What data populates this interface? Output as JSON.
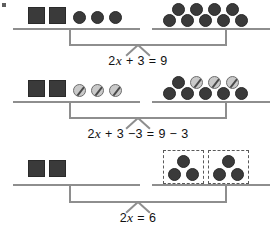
{
  "figure": {
    "background_color": "#ffffff",
    "line_color": "#8e8e8e",
    "object_fill_color": "#3a3a3a",
    "crossed_fill_color": "#c9c9c9",
    "dashbox_color": "#5a5a5a"
  },
  "steps": [
    {
      "id": "step-1",
      "equation": {
        "full": "2x + 3 = 9",
        "lhs_coefficient": "2",
        "variable": "x",
        "lhs_constant": "+ 3",
        "equals": "=",
        "rhs": "9"
      },
      "left_pan": {
        "squares": 2,
        "circles": 3,
        "crossed_circles": 0,
        "label": "2 x-boxes and 3 unit-circles"
      },
      "right_pan": {
        "squares": 0,
        "circles": 9,
        "crossed_circles": 0,
        "top_row_circles": 4,
        "bottom_row_circles": 5,
        "label": "9 unit-circles"
      }
    },
    {
      "id": "step-2",
      "equation": {
        "full": "2x + 3 −3 = 9 − 3",
        "lhs_coefficient": "2",
        "variable": "x",
        "lhs_constant": "+ 3",
        "lhs_subtract": "−3",
        "equals": "=",
        "rhs": "9 − 3"
      },
      "left_pan": {
        "squares": 2,
        "circles": 0,
        "crossed_circles": 3,
        "label": "2 x-boxes and 3 crossed-out unit-circles"
      },
      "right_pan": {
        "squares": 0,
        "circles": 6,
        "crossed_circles": 3,
        "top_row_circles": 1,
        "top_row_crossed": 3,
        "bottom_row_circles": 5,
        "label": "6 unit-circles with 3 crossed out"
      }
    },
    {
      "id": "step-3",
      "equation": {
        "full": "2x = 6",
        "lhs_coefficient": "2",
        "variable": "x",
        "equals": "=",
        "rhs": "6"
      },
      "left_pan": {
        "squares": 2,
        "circles": 0,
        "crossed_circles": 0,
        "label": "2 x-boxes"
      },
      "right_pan": {
        "squares": 0,
        "circles": 6,
        "crossed_circles": 0,
        "groups": 2,
        "circles_per_group": 3,
        "grouped": true,
        "label": "6 unit-circles grouped into 2 dashed boxes of 3"
      }
    }
  ]
}
